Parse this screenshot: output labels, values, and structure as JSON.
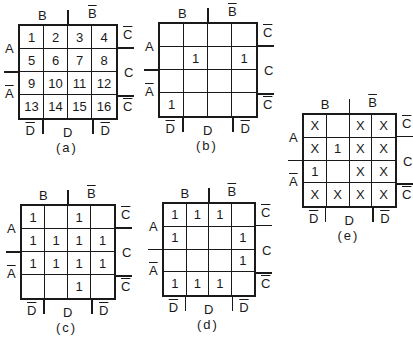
{
  "labels": {
    "B": "B",
    "Bbar": "B",
    "A": "A",
    "Abar": "A",
    "C": "C",
    "Cbar": "C",
    "D": "D",
    "Dbar": "D"
  },
  "maps": [
    {
      "id": "a",
      "caption": "(a)",
      "cells": [
        [
          "1",
          "2",
          "3",
          "4"
        ],
        [
          "5",
          "6",
          "7",
          "8"
        ],
        [
          "9",
          "10",
          "11",
          "12"
        ],
        [
          "13",
          "14",
          "15",
          "16"
        ]
      ]
    },
    {
      "id": "b",
      "caption": "(b)",
      "cells": [
        [
          "",
          "",
          "",
          ""
        ],
        [
          "",
          "1",
          "",
          "1"
        ],
        [
          "",
          "",
          "",
          ""
        ],
        [
          "1",
          "",
          "",
          ""
        ]
      ]
    },
    {
      "id": "c",
      "caption": "(c)",
      "cells": [
        [
          "1",
          "",
          "1",
          ""
        ],
        [
          "1",
          "1",
          "1",
          "1"
        ],
        [
          "1",
          "1",
          "1",
          "1"
        ],
        [
          "",
          "",
          "1",
          ""
        ]
      ]
    },
    {
      "id": "d",
      "caption": "(d)",
      "cells": [
        [
          "1",
          "1",
          "1",
          ""
        ],
        [
          "1",
          "",
          "",
          "1"
        ],
        [
          "",
          "",
          "",
          "1"
        ],
        [
          "1",
          "1",
          "1",
          ""
        ]
      ]
    },
    {
      "id": "e",
      "caption": "(e)",
      "cells": [
        [
          "X",
          "",
          "X",
          "X"
        ],
        [
          "X",
          "1",
          "X",
          "X"
        ],
        [
          "1",
          "",
          "X",
          "X"
        ],
        [
          "X",
          "X",
          "X",
          "X"
        ]
      ]
    }
  ],
  "footer": "(caption text cut off at bottom edge)"
}
